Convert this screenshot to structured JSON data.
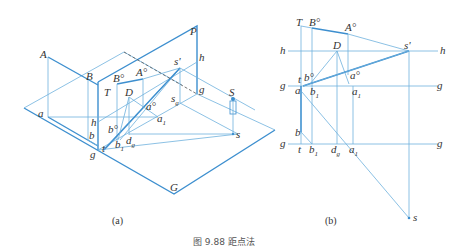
{
  "figure": {
    "caption_partial": "图 9.88  距点法",
    "subfigures": [
      {
        "id": "a",
        "caption": "(a)",
        "labels": {
          "A": "A",
          "B": "B",
          "P": "P",
          "T": "T",
          "Bo": "B°",
          "Ao": "A°",
          "s_prime": "s'",
          "h_top": "h",
          "D": "D",
          "a_o": "a°",
          "s_g": "s",
          "s_g_sub": "g",
          "g_right": "g",
          "S": "S",
          "s": "s",
          "a": "a",
          "a1": "a",
          "a1_sub": "1",
          "h": "h",
          "b_o": "b°",
          "b": "b",
          "b1": "b",
          "b1_sub": "1",
          "d_g": "d",
          "d_g_sub": "g",
          "g": "g",
          "t": "t",
          "G": "G"
        }
      },
      {
        "id": "b",
        "caption": "(b)",
        "labels": {
          "T": "T",
          "Bo": "B°",
          "Ao": "A°",
          "h_left": "h",
          "D": "D",
          "s_prime": "s'",
          "h_right": "h",
          "t_top": "t",
          "b_o": "b°",
          "a_o": "a°",
          "g_left1": "g",
          "a": "a",
          "b1": "b",
          "b1_sub": "1",
          "a1": "a",
          "a1_sub": "1",
          "g_right1": "g",
          "b": "b",
          "g_left2": "g",
          "t": "t",
          "b1b": "b",
          "b1b_sub": "1",
          "d_g": "d",
          "d_g_sub": "g",
          "a1b": "a",
          "a1b_sub": "1",
          "g_right2": "g",
          "s": "s"
        }
      }
    ],
    "colors": {
      "line": "#6fb1dd",
      "line_bold": "#3d8fcf",
      "text": "#333333"
    }
  }
}
